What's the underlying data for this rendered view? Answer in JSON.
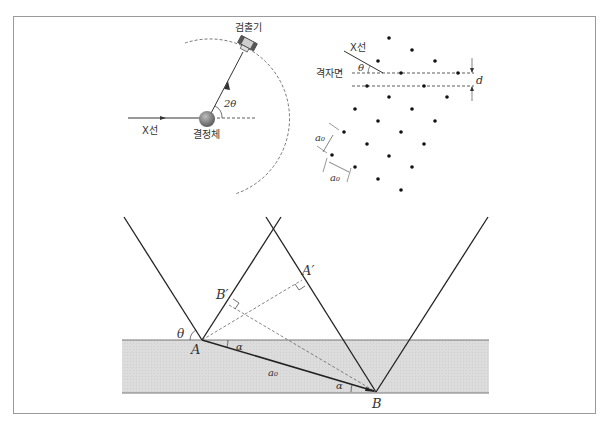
{
  "figure1": {
    "detector_label": "검출기",
    "xray_label": "X선",
    "crystal_label": "결정체",
    "angle_label": "2θ"
  },
  "figure2": {
    "xray_label": "X선",
    "plane_label": "격자면",
    "theta_label": "θ",
    "spacing_label": "d",
    "lattice_const_label_1": "a₀",
    "lattice_const_label_2": "a₀"
  },
  "figure3": {
    "point_A": "A",
    "point_B": "B",
    "point_A_prime": "A′",
    "point_B_prime": "B′",
    "theta_label": "θ",
    "alpha_label_1": "α",
    "alpha_label_2": "α",
    "a0_label": "a₀"
  },
  "colors": {
    "frame": "#9a9a9a",
    "line": "#222222",
    "band": "#d9d9d9",
    "dashed": "#666666"
  }
}
